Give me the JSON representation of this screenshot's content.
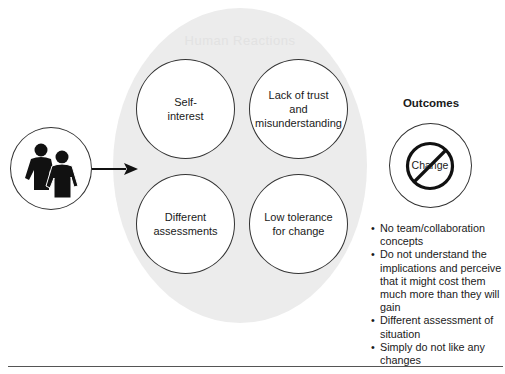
{
  "diagram": {
    "central_group": {
      "header_faint": "Human Reactions",
      "causes": [
        {
          "label": "Self-\ninterest"
        },
        {
          "label": "Lack of trust\nand\nmisunderstanding"
        },
        {
          "label": "Different\nassessments"
        },
        {
          "label": "Low tolerance\nfor change"
        }
      ]
    },
    "source": {
      "icon": "people-icon"
    },
    "outcomes": {
      "title": "Outcomes",
      "symbol_label": "Change",
      "symbol_icon": "prohibition-icon",
      "items": [
        "No team/collaboration concepts",
        "Do not understand the implications and perceive that it might cost them much more than they will gain",
        "Different assessment of situation",
        "Simply do not like any changes"
      ]
    },
    "colors": {
      "ellipse_fill": "#ececec",
      "stroke": "#333333",
      "text": "#1a1a1a"
    }
  }
}
